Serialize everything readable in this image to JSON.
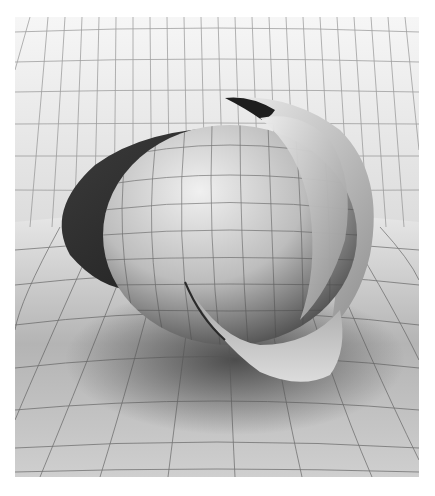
{
  "image": {
    "description": "Grayscale 3D render of a sphere wrapped by twisted ribbon-like surfaces over a curved gridded floor and backdrop",
    "width": 435,
    "height": 496,
    "render_area": {
      "x": 15,
      "y": 17,
      "width": 404,
      "height": 460
    },
    "colors": {
      "background": "#ffffff",
      "grid_line": "#6a6a6a",
      "backdrop_light": "#f4f4f4",
      "floor_light": "#e6e6e6",
      "floor_dark": "#8a8a8a",
      "sphere_light": "#e8e8e8",
      "sphere_dark": "#5a5a5a",
      "ribbon_shadow": "#2a2a2a"
    }
  }
}
